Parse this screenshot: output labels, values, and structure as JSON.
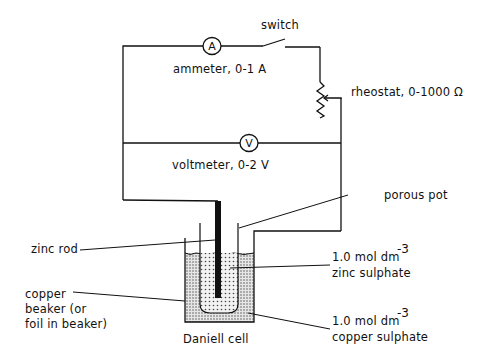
{
  "diagram": {
    "labels": {
      "switch": "switch",
      "ammeter": "ammeter, 0-1 A",
      "rheostat": "rheostat, 0-1000 Ω",
      "voltmeter": "voltmeter, 0-2 V",
      "porous_pot": "porous pot",
      "zinc_rod": "zinc rod",
      "zinc_sulphate_conc": "1.0 mol dm",
      "zinc_sulphate_exp": "-3",
      "zinc_sulphate_name": "zinc sulphate",
      "copper_beaker_line1": "copper",
      "copper_beaker_line2": "beaker (or",
      "copper_beaker_line3": "foil in beaker)",
      "cell_name": "Daniell cell",
      "copper_sulphate_conc": "1.0 mol dm",
      "copper_sulphate_exp": "-3",
      "copper_sulphate_name": "copper sulphate"
    },
    "meters": {
      "ammeter_symbol": "A",
      "voltmeter_symbol": "V"
    },
    "components": [
      "switch",
      "ammeter",
      "rheostat",
      "voltmeter",
      "porous pot",
      "zinc rod",
      "zinc sulphate solution",
      "copper beaker",
      "copper sulphate solution"
    ],
    "colors": {
      "line": "#111111",
      "background": "#ffffff",
      "solution_dots": "#555555"
    }
  }
}
